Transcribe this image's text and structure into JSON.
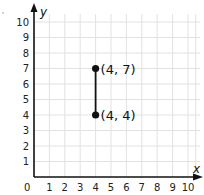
{
  "chart_data": {
    "type": "scatter",
    "title": "",
    "xlabel": "x",
    "ylabel": "y",
    "xlim": [
      0,
      10
    ],
    "ylim": [
      0,
      10
    ],
    "grid": true,
    "x_ticks": [
      "1",
      "2",
      "3",
      "4",
      "5",
      "6",
      "7",
      "8",
      "9",
      "10"
    ],
    "y_ticks": [
      "1",
      "2",
      "3",
      "4",
      "5",
      "6",
      "7",
      "8",
      "9",
      "10"
    ],
    "origin_label": "0",
    "points": [
      {
        "x": 4,
        "y": 7,
        "label": "(4, 7)"
      },
      {
        "x": 4,
        "y": 4,
        "label": "(4, 4)"
      }
    ],
    "segments": [
      {
        "from": [
          4,
          4
        ],
        "to": [
          4,
          7
        ]
      }
    ],
    "colors": {
      "grid": "#e2e2e2",
      "axis": "#111111",
      "point": "#111111"
    }
  }
}
